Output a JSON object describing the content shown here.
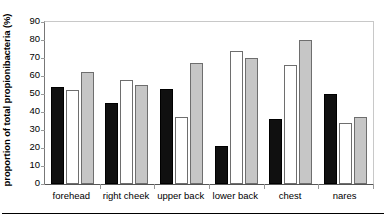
{
  "chart_data": {
    "type": "bar",
    "title": "",
    "xlabel": "",
    "ylabel": "proportion of total propionibacteria (%)",
    "ylim": [
      0,
      90
    ],
    "ytick_step": 10,
    "yticks": [
      90,
      80,
      70,
      60,
      50,
      40,
      30,
      20,
      10,
      0
    ],
    "grid": false,
    "legend": "none",
    "categories": [
      "forehead",
      "right cheek",
      "upper back",
      "lower back",
      "chest",
      "nares"
    ],
    "series": [
      {
        "name": "series-1",
        "style": "black",
        "color": "#101010",
        "values": [
          54,
          45,
          53,
          21,
          36,
          50
        ]
      },
      {
        "name": "series-2",
        "style": "white",
        "color": "#ffffff",
        "values": [
          52,
          58,
          37,
          74,
          66,
          34
        ]
      },
      {
        "name": "series-3",
        "style": "gray",
        "color": "#c6c6c6",
        "values": [
          62,
          55,
          67,
          70,
          80,
          37
        ]
      }
    ]
  },
  "axis": {
    "y_title": "proportion of total propionibacteria (%)",
    "y_labels": [
      "90",
      "80",
      "70",
      "60",
      "50",
      "40",
      "30",
      "20",
      "10",
      "0"
    ],
    "x_labels": [
      "forehead",
      "right cheek",
      "upper back",
      "lower back",
      "chest",
      "nares"
    ]
  }
}
